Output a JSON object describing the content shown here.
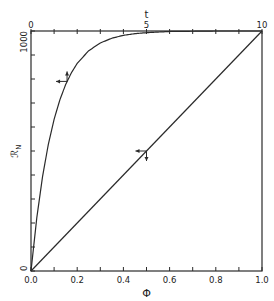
{
  "chart_data": {
    "type": "line",
    "title": "",
    "xlabel_bottom": "Φ",
    "xlabel_top": "t",
    "ylabel": "ℛ_N",
    "ylabel_main": "ℛ",
    "ylabel_sub": "N",
    "xlim_bottom": [
      0,
      1
    ],
    "xlim_top": [
      0,
      10
    ],
    "ylim": [
      0,
      1000
    ],
    "grid": false,
    "legend": null,
    "bottom_ticks": [
      0.0,
      0.1,
      0.2,
      0.3,
      0.4,
      0.5,
      0.6,
      0.7,
      0.8,
      0.9,
      1.0
    ],
    "bottom_tick_labels": [
      "0.0",
      "0.2",
      "0.4",
      "0.6",
      "0.8",
      "1.0"
    ],
    "top_ticks": [
      0,
      1,
      2,
      3,
      4,
      5,
      6,
      7,
      8,
      9,
      10
    ],
    "top_tick_labels": [
      "0",
      "5",
      "10"
    ],
    "left_ticks": [
      0,
      100,
      200,
      300,
      400,
      500,
      600,
      700,
      800,
      900,
      1000
    ],
    "left_tick_labels": [
      "0",
      "1000"
    ],
    "series": [
      {
        "name": "R_N vs t (top axis)",
        "axis": "top",
        "x": [
          0,
          0.25,
          0.5,
          0.75,
          1,
          1.25,
          1.5,
          1.75,
          2,
          2.5,
          3,
          3.5,
          4,
          4.5,
          5,
          6,
          7,
          8,
          9,
          10
        ],
        "y": [
          0,
          221,
          393,
          528,
          632,
          713,
          777,
          826,
          865,
          918,
          950,
          970,
          982,
          989,
          993,
          998,
          999,
          1000,
          1000,
          1000
        ],
        "arrow_at": 0.85,
        "arrow_dirs": [
          "left",
          "up"
        ]
      },
      {
        "name": "R_N vs Φ (bottom axis)",
        "axis": "bottom",
        "x": [
          0,
          1
        ],
        "y": [
          0,
          1000
        ],
        "arrow_at": 0.5,
        "arrow_dirs": [
          "left",
          "down"
        ]
      }
    ]
  }
}
